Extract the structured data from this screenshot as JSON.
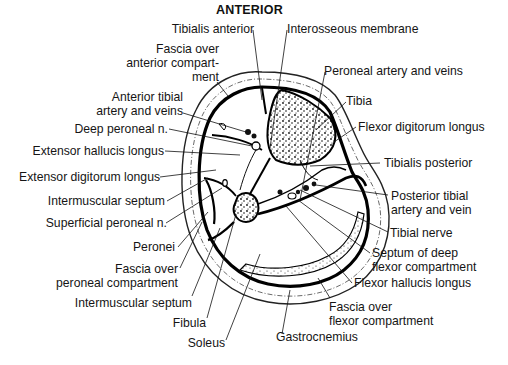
{
  "title": "ANTERIOR",
  "labels": {
    "tibialis_anterior": "Tibialis anterior",
    "interosseous_membrane": "Interosseous membrane",
    "fascia_anterior_1": "Fascia over",
    "fascia_anterior_2": "anterior compart-",
    "fascia_anterior_3": "ment",
    "peroneal_artery": "Peroneal artery and veins",
    "anterior_tibial_1": "Anterior tibial",
    "anterior_tibial_2": "artery and veins",
    "tibia": "Tibia",
    "deep_peroneal": "Deep peroneal n.",
    "flexor_digitorum": "Flexor digitorum longus",
    "extensor_hallucis": "Extensor hallucis longus",
    "tibialis_posterior": "Tibialis posterior",
    "extensor_digitorum": "Extensor digitorum longus",
    "posterior_tibial_1": "Posterior tibial",
    "posterior_tibial_2": "artery and vein",
    "intermuscular_septum_1": "Intermuscular septum",
    "tibial_nerve": "Tibial nerve",
    "superficial_peroneal": "Superficial peroneal n.",
    "septum_deep_1": "Septum of deep",
    "septum_deep_2": "flexor compartment",
    "peronei": "Peronei",
    "flexor_hallucis": "Flexor hallucis longus",
    "fascia_peroneal_1": "Fascia over",
    "fascia_peroneal_2": "peroneal compartment",
    "fascia_flexor_1": "Fascia over",
    "fascia_flexor_2": "flexor compartment",
    "intermuscular_septum_2": "Intermuscular septum",
    "fibula": "Fibula",
    "gastrocnemius": "Gastrocnemius",
    "soleus": "Soleus"
  }
}
